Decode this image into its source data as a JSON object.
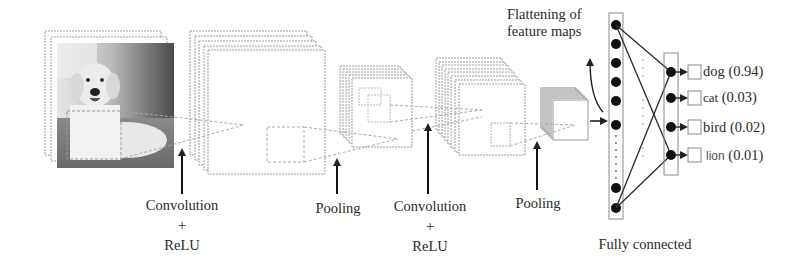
{
  "diagram": {
    "input_image": {
      "subject": "dog photo (grayscale)",
      "icon": "dog-photo"
    },
    "stages": [
      {
        "id": "conv1",
        "label_line1": "Convolution",
        "label_plus": "+",
        "label_line2": "ReLU"
      },
      {
        "id": "pool1",
        "label": "Pooling"
      },
      {
        "id": "conv2",
        "label_line1": "Convolution",
        "label_plus": "+",
        "label_line2": "ReLU"
      },
      {
        "id": "pool2",
        "label": "Pooling"
      }
    ],
    "flatten": {
      "label_line1": "Flattening of",
      "label_line2": "feature maps"
    },
    "fully_connected": {
      "label": "Fully connected"
    },
    "outputs": [
      {
        "class": "dog",
        "score": "(0.94)"
      },
      {
        "class": "cat",
        "score": "(0.03)"
      },
      {
        "class": "bird",
        "score": "(0.02)"
      },
      {
        "class": "lion",
        "score": "(0.01)"
      }
    ],
    "colors": {
      "line": "#2a2a2a",
      "frame": "#9a9a9a",
      "node": "#111111",
      "background": "#ffffff"
    }
  }
}
